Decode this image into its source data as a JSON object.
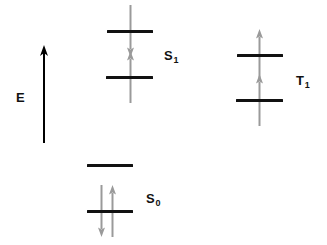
{
  "canvas": {
    "width": 327,
    "height": 245,
    "background": "#ffffff"
  },
  "colors": {
    "level_bar": "#111111",
    "spin_arrow": "#9a9a9a",
    "axis": "#000000",
    "label": "#111111"
  },
  "axis": {
    "label": "E",
    "label_text": "E",
    "description": "vertical energy axis arrow pointing up",
    "x": 44,
    "y_bottom": 143,
    "y_top": 45,
    "label_x": 16,
    "label_y": 91
  },
  "states": [
    {
      "id": "S0",
      "symbol": "S",
      "subscript": "0",
      "label_x": 146,
      "label_y": 192,
      "levels": [
        {
          "name": "s0-upper-level",
          "x": 87,
          "y": 165,
          "width": 46,
          "electrons": []
        },
        {
          "name": "s0-lower-level",
          "x": 87,
          "y": 211,
          "width": 46,
          "electrons": [
            {
              "name": "spin-down-arrow",
              "direction": "down",
              "offset_x": 14
            },
            {
              "name": "spin-up-arrow",
              "direction": "up",
              "offset_x": 25
            }
          ]
        }
      ]
    },
    {
      "id": "S1",
      "symbol": "S",
      "subscript": "1",
      "label_x": 164,
      "label_y": 49,
      "levels": [
        {
          "name": "s1-upper-level",
          "x": 107,
          "y": 31,
          "width": 46,
          "electrons": [
            {
              "name": "spin-down-arrow",
              "direction": "down",
              "offset_x": 23
            }
          ]
        },
        {
          "name": "s1-lower-level",
          "x": 106,
          "y": 77,
          "width": 47,
          "electrons": [
            {
              "name": "spin-up-arrow",
              "direction": "up",
              "offset_x": 24
            }
          ]
        }
      ]
    },
    {
      "id": "T1",
      "symbol": "T",
      "subscript": "1",
      "label_x": 296,
      "label_y": 74,
      "levels": [
        {
          "name": "t1-upper-level",
          "x": 237,
          "y": 55,
          "width": 46,
          "electrons": [
            {
              "name": "spin-up-arrow",
              "direction": "up",
              "offset_x": 22
            }
          ]
        },
        {
          "name": "t1-lower-level",
          "x": 236,
          "y": 100,
          "width": 47,
          "electrons": [
            {
              "name": "spin-up-arrow",
              "direction": "up",
              "offset_x": 23
            }
          ]
        }
      ]
    }
  ],
  "geometry": {
    "bar_thickness": 3,
    "arrow_half_length": 26,
    "arrow_shaft_width": 2,
    "arrow_head_width": 7,
    "arrow_head_height": 9
  }
}
